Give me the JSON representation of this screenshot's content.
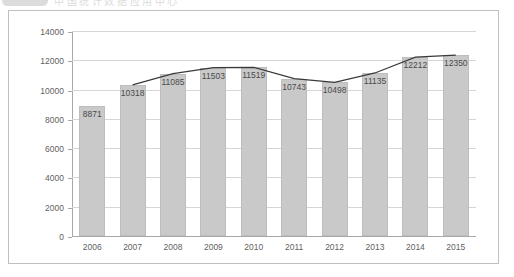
{
  "header": {
    "badge_icon": "rounded-logo-badge",
    "title": "中国统计数据应用中心"
  },
  "panel": {
    "border_color": "#bfbfbf",
    "background": "#ffffff"
  },
  "chart_data": {
    "type": "bar",
    "title": "",
    "subtitle": "",
    "xlabel": "",
    "ylabel": "",
    "categories": [
      "2006",
      "2007",
      "2008",
      "2009",
      "2010",
      "2011",
      "2012",
      "2013",
      "2014",
      "2015"
    ],
    "values": [
      8871,
      10318,
      11085,
      11503,
      11519,
      10743,
      10498,
      11135,
      12212,
      12350
    ],
    "data_labels": [
      "8871",
      "10318",
      "11085",
      "11503",
      "11519",
      "10743",
      "10498",
      "11135",
      "12212",
      "12350"
    ],
    "series": [
      {
        "name": "bars",
        "type": "bar",
        "color": "#c9c9c9",
        "border_color": "#bdbdbd",
        "values": [
          8871,
          10318,
          11085,
          11503,
          11519,
          10743,
          10498,
          11135,
          12212,
          12350
        ]
      },
      {
        "name": "trend-line",
        "type": "line",
        "color": "#3a3a3a",
        "starts_at_category": "2007",
        "values": [
          null,
          10318,
          11085,
          11503,
          11519,
          10743,
          10498,
          11135,
          12212,
          12350
        ]
      }
    ],
    "ylim": [
      0,
      14000
    ],
    "ytick_step": 2000,
    "ytick_labels": [
      "0",
      "2000",
      "4000",
      "6000",
      "8000",
      "10000",
      "12000",
      "14000"
    ],
    "grid": true,
    "grid_color": "#d6d6d6",
    "axis_color": "#a8a8a8",
    "legend": false,
    "legend_position": "none"
  }
}
